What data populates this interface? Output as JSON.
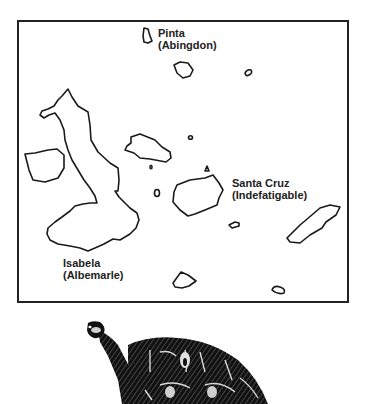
{
  "map": {
    "frame_color": "#222222",
    "labels": {
      "pinta": {
        "name": "Pinta",
        "alt": "(Abingdon)"
      },
      "santa_cruz": {
        "name": "Santa Cruz",
        "alt": "(Indefatigable)"
      },
      "isabela": {
        "name": "Isabela",
        "alt": "(Albemarle)"
      }
    }
  },
  "illustration": {
    "subject": "giant-tortoise"
  }
}
